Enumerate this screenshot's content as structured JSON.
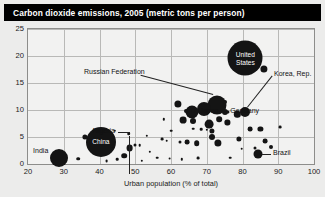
{
  "title": "Carbon dioxide emissions, 2005 (metric tons per person)",
  "chart_data": {
    "type": "scatter",
    "title": "Carbon dioxide emissions, 2005 (metric tons per person)",
    "xlabel": "Urban population (% of total)",
    "ylabel": "",
    "xlim": [
      20,
      100
    ],
    "ylim": [
      0,
      25
    ],
    "xticks": [
      20,
      30,
      40,
      50,
      60,
      70,
      80,
      90,
      100
    ],
    "yticks": [
      0,
      5,
      10,
      15,
      20,
      25
    ],
    "grid": true,
    "legend": "none",
    "size_encodes": "total CO2 emissions (population weighted bubble area)",
    "points": [
      {
        "name": "United States",
        "x": 80.8,
        "y": 19.6,
        "r": 17.5,
        "label": "United States",
        "label_pos": "inside"
      },
      {
        "name": "Russian Federation",
        "x": 72.9,
        "y": 11.0,
        "r": 9.5,
        "label": "Russian Federation",
        "label_pos": "leader-upleft"
      },
      {
        "name": "China",
        "x": 40.4,
        "y": 4.1,
        "r": 15.0,
        "label": "China",
        "label_pos": "inside"
      },
      {
        "name": "India",
        "x": 28.7,
        "y": 1.2,
        "r": 9.0,
        "label": "India",
        "label_pos": "left"
      },
      {
        "name": "Japan",
        "x": 66.0,
        "y": 9.7,
        "r": 6.5,
        "label": "Japan",
        "label_pos": "right"
      },
      {
        "name": "Germany",
        "x": 75.2,
        "y": 9.7,
        "r": 3.0,
        "label": "Germany",
        "label_pos": "right"
      },
      {
        "name": "Korea, Rep.",
        "x": 80.8,
        "y": 9.6,
        "r": 5.0,
        "label": "Korea, Rep.",
        "label_pos": "leader-upright"
      },
      {
        "name": "Brazil",
        "x": 84.2,
        "y": 1.8,
        "r": 4.5,
        "label": "Brazil",
        "label_pos": "leader-right"
      },
      {
        "name": "Nigeria",
        "x": 48.2,
        "y": 5.6,
        "r": 1.8,
        "label": "Nigeria",
        "label_pos": "leader-up"
      },
      {
        "name": "p-usa-neighbor",
        "x": 86.0,
        "y": 17.6,
        "r": 3.6,
        "label": ""
      },
      {
        "name": "p01",
        "x": 62.0,
        "y": 11.1,
        "r": 3.6,
        "label": ""
      },
      {
        "name": "p02",
        "x": 69.3,
        "y": 10.2,
        "r": 7.0,
        "label": ""
      },
      {
        "name": "p03",
        "x": 75.0,
        "y": 11.4,
        "r": 2.0,
        "label": ""
      },
      {
        "name": "p04",
        "x": 64.3,
        "y": 9.8,
        "r": 2.0,
        "label": ""
      },
      {
        "name": "p05",
        "x": 66.2,
        "y": 9.9,
        "r": 1.8,
        "label": ""
      },
      {
        "name": "p06",
        "x": 63.4,
        "y": 8.1,
        "r": 3.4,
        "label": ""
      },
      {
        "name": "p07",
        "x": 66.2,
        "y": 7.9,
        "r": 3.0,
        "label": ""
      },
      {
        "name": "p08",
        "x": 70.6,
        "y": 7.4,
        "r": 4.4,
        "label": ""
      },
      {
        "name": "p09",
        "x": 73.5,
        "y": 8.3,
        "r": 2.8,
        "label": ""
      },
      {
        "name": "p10",
        "x": 75.8,
        "y": 7.7,
        "r": 2.6,
        "label": ""
      },
      {
        "name": "p11",
        "x": 78.5,
        "y": 9.2,
        "r": 3.2,
        "label": ""
      },
      {
        "name": "p12",
        "x": 76.0,
        "y": 9.6,
        "r": 1.6,
        "label": ""
      },
      {
        "name": "p13",
        "x": 71.5,
        "y": 6.2,
        "r": 2.6,
        "label": ""
      },
      {
        "name": "p14",
        "x": 71.4,
        "y": 5.0,
        "r": 3.0,
        "label": ""
      },
      {
        "name": "p15",
        "x": 68.4,
        "y": 6.4,
        "r": 1.3,
        "label": ""
      },
      {
        "name": "p16",
        "x": 70.0,
        "y": 6.3,
        "r": 1.2,
        "label": ""
      },
      {
        "name": "p17",
        "x": 66.2,
        "y": 6.5,
        "r": 1.3,
        "label": ""
      },
      {
        "name": "p18",
        "x": 60.0,
        "y": 6.2,
        "r": 1.3,
        "label": ""
      },
      {
        "name": "p19",
        "x": 57.6,
        "y": 4.6,
        "r": 1.4,
        "label": ""
      },
      {
        "name": "p20",
        "x": 58.8,
        "y": 4.3,
        "r": 1.3,
        "label": ""
      },
      {
        "name": "p21",
        "x": 62.6,
        "y": 4.0,
        "r": 1.5,
        "label": ""
      },
      {
        "name": "p22",
        "x": 64.6,
        "y": 4.1,
        "r": 2.4,
        "label": ""
      },
      {
        "name": "p23",
        "x": 67.2,
        "y": 3.8,
        "r": 2.8,
        "label": ""
      },
      {
        "name": "p24",
        "x": 73.1,
        "y": 3.9,
        "r": 3.6,
        "label": ""
      },
      {
        "name": "p25",
        "x": 79.0,
        "y": 4.6,
        "r": 2.6,
        "label": ""
      },
      {
        "name": "p26",
        "x": 82.2,
        "y": 6.4,
        "r": 2.4,
        "label": ""
      },
      {
        "name": "p27",
        "x": 85.0,
        "y": 6.5,
        "r": 2.6,
        "label": ""
      },
      {
        "name": "p28",
        "x": 86.4,
        "y": 4.2,
        "r": 2.4,
        "label": ""
      },
      {
        "name": "p29",
        "x": 88.0,
        "y": 3.2,
        "r": 2.0,
        "label": ""
      },
      {
        "name": "p30",
        "x": 83.5,
        "y": 3.0,
        "r": 1.5,
        "label": ""
      },
      {
        "name": "p31",
        "x": 79.8,
        "y": 2.8,
        "r": 1.3,
        "label": ""
      },
      {
        "name": "p32",
        "x": 50.0,
        "y": 3.6,
        "r": 1.5,
        "label": ""
      },
      {
        "name": "p33",
        "x": 51.2,
        "y": 3.5,
        "r": 1.3,
        "label": ""
      },
      {
        "name": "p34",
        "x": 54.0,
        "y": 2.3,
        "r": 1.2,
        "label": ""
      },
      {
        "name": "p35",
        "x": 46.9,
        "y": 1.5,
        "r": 2.8,
        "label": ""
      },
      {
        "name": "p36",
        "x": 45.0,
        "y": 0.9,
        "r": 1.3,
        "label": ""
      },
      {
        "name": "p37",
        "x": 36.0,
        "y": 5.0,
        "r": 2.6,
        "label": ""
      },
      {
        "name": "p38",
        "x": 43.8,
        "y": 3.3,
        "r": 1.3,
        "label": ""
      },
      {
        "name": "p39",
        "x": 48.4,
        "y": 3.0,
        "r": 3.4,
        "label": ""
      },
      {
        "name": "p40",
        "x": 34.0,
        "y": 1.0,
        "r": 1.8,
        "label": ""
      },
      {
        "name": "p41",
        "x": 30.6,
        "y": 0.5,
        "r": 1.2,
        "label": ""
      },
      {
        "name": "p42",
        "x": 56.2,
        "y": 1.2,
        "r": 1.3,
        "label": ""
      },
      {
        "name": "p43",
        "x": 59.6,
        "y": 1.0,
        "r": 1.4,
        "label": ""
      },
      {
        "name": "p44",
        "x": 63.0,
        "y": 0.9,
        "r": 1.2,
        "label": ""
      },
      {
        "name": "p45",
        "x": 67.6,
        "y": 1.1,
        "r": 1.4,
        "label": ""
      },
      {
        "name": "p46",
        "x": 51.8,
        "y": 0.6,
        "r": 1.2,
        "label": ""
      },
      {
        "name": "p47",
        "x": 76.5,
        "y": 1.2,
        "r": 1.3,
        "label": ""
      },
      {
        "name": "p48",
        "x": 58.0,
        "y": 8.3,
        "r": 1.2,
        "label": ""
      },
      {
        "name": "p49",
        "x": 53.2,
        "y": 5.2,
        "r": 1.2,
        "label": ""
      },
      {
        "name": "p50",
        "x": 90.5,
        "y": 6.8,
        "r": 1.4,
        "label": ""
      },
      {
        "name": "p51",
        "x": 44.2,
        "y": 6.2,
        "r": 1.2,
        "label": ""
      },
      {
        "name": "p52",
        "x": 42.0,
        "y": 0.6,
        "r": 1.4,
        "label": ""
      }
    ]
  },
  "annotations": {
    "united_states": "United States",
    "russian_federation": "Russian Federation",
    "china": "China",
    "india": "India",
    "japan": "Japan",
    "germany": "Germany",
    "korea_rep": "Korea, Rep.",
    "brazil": "Brazil",
    "nigeria": "Nigeria"
  }
}
